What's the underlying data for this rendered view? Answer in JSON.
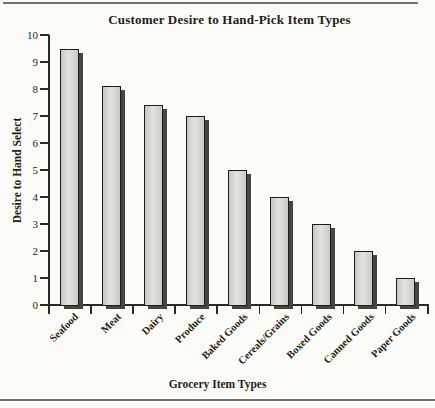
{
  "page": {
    "background": "#fcfbf7",
    "rule_color": "#75726b"
  },
  "chart_data": {
    "type": "bar",
    "title": "Customer Desire to Hand-Pick Item Types",
    "xlabel": "Grocery Item Types",
    "ylabel": "Desire to Hand Select",
    "categories": [
      "Seafood",
      "Meat",
      "Dairy",
      "Produce",
      "Baked Goods",
      "Cereals/Grains",
      "Boxed Goods",
      "Canned Goods",
      "Paper Goods"
    ],
    "values": [
      9.5,
      8.1,
      7.4,
      7,
      5,
      4,
      3,
      2,
      1
    ],
    "ylim": [
      0,
      10
    ],
    "yticks": [
      0,
      1,
      2,
      3,
      4,
      5,
      6,
      7,
      8,
      9,
      10
    ],
    "grid": false,
    "legend_position": "none",
    "bar_style": {
      "fill": "#d8d6d1",
      "border": "#1d1c18",
      "shadow": "#474540"
    },
    "axis_color": "#2a2a26",
    "text_color": "#211f1a"
  }
}
